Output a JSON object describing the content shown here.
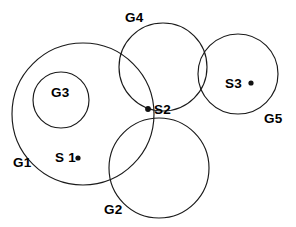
{
  "diagram": {
    "background_color": "#ffffff",
    "stroke_color": "#1a1a1a",
    "label_color": "#000000",
    "width": 296,
    "height": 227
  },
  "chart_data": {
    "type": "diagram",
    "subtype": "euler-venn-sets",
    "title": "",
    "circles": [
      {
        "id": "G1",
        "label": "G1",
        "cx": 83,
        "cy": 114,
        "r": 71
      },
      {
        "id": "G3",
        "label": "G3",
        "cx": 61,
        "cy": 100,
        "r": 28
      },
      {
        "id": "G4",
        "label": "G4",
        "cx": 163,
        "cy": 67,
        "r": 44
      },
      {
        "id": "G2",
        "label": "G2",
        "cx": 159,
        "cy": 168,
        "r": 50
      },
      {
        "id": "G5",
        "label": "G5",
        "cx": 238,
        "cy": 74,
        "r": 40
      }
    ],
    "points": [
      {
        "id": "S1",
        "label": "S 1",
        "cx": 78,
        "cy": 158,
        "dot_r": 2.6
      },
      {
        "id": "S2",
        "label": "S2",
        "cx": 148,
        "cy": 109,
        "dot_r": 2.9
      },
      {
        "id": "S3",
        "label": "S3",
        "cx": 251,
        "cy": 83,
        "dot_r": 2.6
      }
    ],
    "circle_label_positions": [
      {
        "id": "G1",
        "x": 13,
        "y": 167,
        "anchor": "start"
      },
      {
        "id": "G3",
        "x": 51,
        "y": 97,
        "anchor": "start"
      },
      {
        "id": "G4",
        "x": 125,
        "y": 22,
        "anchor": "start"
      },
      {
        "id": "G2",
        "x": 104,
        "y": 214,
        "anchor": "start"
      },
      {
        "id": "G5",
        "x": 264,
        "y": 123,
        "anchor": "start"
      }
    ],
    "point_label_positions": [
      {
        "id": "S1",
        "x": 55,
        "y": 162,
        "anchor": "start"
      },
      {
        "id": "S2",
        "x": 154,
        "y": 114,
        "anchor": "start"
      },
      {
        "id": "S3",
        "x": 225,
        "y": 88,
        "anchor": "start"
      }
    ]
  },
  "labels": {
    "G1": "G1",
    "G2": "G2",
    "G3": "G3",
    "G4": "G4",
    "G5": "G5",
    "S1": "S 1",
    "S2": "S2",
    "S3": "S3"
  }
}
